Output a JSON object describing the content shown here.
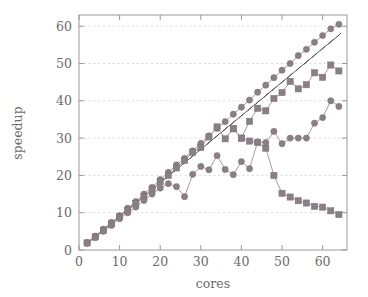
{
  "chart_data": {
    "type": "line",
    "title": "",
    "xlabel": "cores",
    "ylabel": "speedup",
    "xlim": [
      0,
      66
    ],
    "ylim": [
      0,
      63
    ],
    "xticks": [
      0,
      10,
      20,
      30,
      40,
      50,
      60
    ],
    "yticks": [
      0,
      10,
      20,
      30,
      40,
      50,
      60
    ],
    "grid": "horizontal-dashed",
    "legend_position": "none",
    "colors": {
      "series_marker": "#8b7f86",
      "series_line": "#9d9098",
      "ideal_line": "#4a4a4a",
      "grid": "#d9cfd4",
      "frame": "#9a9a9a",
      "text": "#6b6b6b"
    },
    "series": [
      {
        "name": "ideal-linear-reference",
        "marker": "tick",
        "x": [
          2,
          4,
          6,
          8,
          10,
          12,
          14,
          16,
          18,
          20,
          22,
          24,
          26,
          28,
          30,
          32,
          34,
          36,
          38,
          40,
          42,
          44,
          46,
          48,
          50,
          52,
          54,
          56,
          58,
          60,
          62,
          64
        ],
        "values": [
          1.8,
          3.6,
          5.4,
          7.2,
          9.0,
          10.8,
          12.6,
          14.4,
          16.2,
          18.0,
          19.8,
          21.6,
          23.4,
          25.2,
          27.0,
          28.8,
          30.6,
          32.4,
          34.2,
          36.0,
          37.8,
          39.6,
          41.4,
          43.2,
          45.0,
          46.8,
          48.6,
          50.4,
          52.2,
          54.0,
          55.8,
          57.6
        ]
      },
      {
        "name": "near-linear-scaling",
        "marker": "circle",
        "x": [
          2,
          4,
          6,
          8,
          10,
          12,
          14,
          16,
          18,
          20,
          22,
          24,
          26,
          28,
          30,
          32,
          34,
          36,
          38,
          40,
          42,
          44,
          46,
          48,
          50,
          52,
          54,
          56,
          58,
          60,
          62,
          64
        ],
        "values": [
          2.0,
          3.7,
          5.6,
          7.4,
          9.2,
          11.2,
          13.0,
          15.0,
          16.8,
          18.9,
          20.8,
          22.8,
          24.6,
          26.6,
          28.6,
          30.6,
          32.6,
          34.4,
          36.4,
          38.3,
          40.2,
          42.3,
          44.2,
          46.2,
          48.2,
          50.0,
          52.1,
          53.8,
          55.7,
          57.5,
          59.3,
          60.5
        ]
      },
      {
        "name": "scaling-then-collapse",
        "marker": "square",
        "x": [
          2,
          4,
          6,
          8,
          10,
          12,
          14,
          16,
          18,
          20,
          22,
          24,
          26,
          28,
          30,
          32,
          34,
          36,
          38,
          40,
          42,
          44,
          46,
          48,
          50,
          52,
          54,
          56,
          58,
          60,
          62,
          64
        ],
        "values": [
          1.9,
          3.5,
          5.3,
          7.0,
          8.9,
          10.6,
          12.5,
          14.3,
          16.2,
          18.3,
          20.0,
          22.0,
          24.0,
          26.2,
          27.5,
          30.3,
          33.0,
          29.8,
          32.5,
          30.0,
          34.5,
          38.0,
          37.3,
          40.6,
          42.2,
          45.2,
          43.2,
          44.3,
          47.5,
          46.3,
          49.6,
          48.0
        ]
      },
      {
        "name": "degrading-series",
        "marker": "square",
        "x": [
          38,
          40,
          42,
          44,
          46,
          48,
          50,
          52,
          54,
          56,
          58,
          60,
          62,
          64
        ],
        "values": [
          32.5,
          30.0,
          29.2,
          28.8,
          27.3,
          20.0,
          15.2,
          14.2,
          13.2,
          12.6,
          11.7,
          11.5,
          10.5,
          9.5
        ]
      },
      {
        "name": "plateau-series",
        "marker": "circle",
        "x": [
          2,
          4,
          6,
          8,
          10,
          12,
          14,
          16,
          18,
          20,
          22,
          24,
          26,
          28,
          30,
          32,
          34,
          36,
          38,
          40,
          42,
          44,
          46,
          48,
          50,
          52,
          54,
          56,
          58,
          60,
          62,
          64
        ],
        "values": [
          1.8,
          3.3,
          5.0,
          6.6,
          8.4,
          10.0,
          11.5,
          13.3,
          15.0,
          16.6,
          17.8,
          17.0,
          14.3,
          20.3,
          22.4,
          21.5,
          25.3,
          21.6,
          20.2,
          23.7,
          21.8,
          29.0,
          28.8,
          31.8,
          28.5,
          30.0,
          30.0,
          30.0,
          34.0,
          35.5,
          40.0,
          38.5
        ]
      }
    ]
  }
}
